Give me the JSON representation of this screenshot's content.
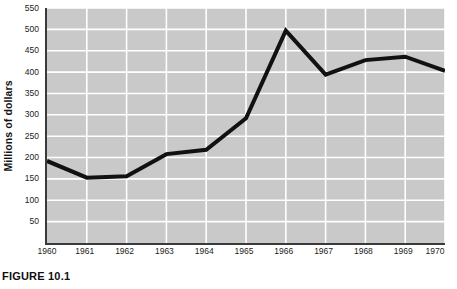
{
  "figure": {
    "caption": "FIGURE 10.1"
  },
  "chart_data": {
    "type": "line",
    "title": "",
    "xlabel": "",
    "ylabel": "Millions of dollars",
    "x": [
      1960,
      1961,
      1962,
      1963,
      1964,
      1965,
      1966,
      1967,
      1968,
      1969,
      1970
    ],
    "categories": [
      "1960",
      "1961",
      "1962",
      "1963",
      "1964",
      "1965",
      "1966",
      "1967",
      "1968",
      "1969",
      "1970"
    ],
    "values": [
      192,
      153,
      156,
      208,
      218,
      292,
      497,
      394,
      428,
      436,
      403
    ],
    "series": [
      {
        "name": "Millions of dollars",
        "values": [
          192,
          153,
          156,
          208,
          218,
          292,
          497,
          394,
          428,
          436,
          403
        ]
      }
    ],
    "xlim": [
      1960,
      1970
    ],
    "ylim": [
      0,
      550
    ],
    "yticks": [
      550,
      500,
      450,
      400,
      350,
      300,
      250,
      200,
      150,
      100,
      50
    ],
    "ytick_labels": [
      "550",
      "500",
      "450",
      "400",
      "350",
      "300",
      "250",
      "200",
      "150",
      "100",
      "50"
    ],
    "xticks": [
      1960,
      1961,
      1962,
      1963,
      1964,
      1965,
      1966,
      1967,
      1968,
      1969,
      1970
    ],
    "xtick_labels": [
      "1960",
      "1961",
      "1962",
      "1963",
      "1964",
      "1965",
      "1966",
      "1967",
      "1968",
      "1969",
      "1970"
    ],
    "grid": true,
    "grid_color": "#ffffff",
    "plot_background": "#c9c9c9",
    "line_color": "#111111",
    "line_width": 4,
    "legend": false,
    "legend_position": "none"
  }
}
